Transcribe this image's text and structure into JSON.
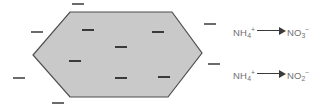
{
  "figure": {
    "name": "soil-colloid-nitrification-diagram",
    "background_color": "#ffffff"
  },
  "colloid": {
    "name": "hexagonal-soil-colloid",
    "shape": "hexagon",
    "fill_color": "#c9c9c9",
    "stroke_color": "#4d4d4d",
    "points": "70,12 172,12 202,53 168,97 70,97 33,55",
    "charge_symbol": "−"
  },
  "charges": {
    "symbol": "−",
    "color_interior": "#3a3a3a",
    "color_exterior": "#6b6b6b",
    "interior": [
      {
        "name": "charge-interior-1",
        "x": 88,
        "y": 30
      },
      {
        "name": "charge-interior-2",
        "x": 158,
        "y": 32
      },
      {
        "name": "charge-interior-3",
        "x": 121,
        "y": 47
      },
      {
        "name": "charge-interior-4",
        "x": 75,
        "y": 61
      },
      {
        "name": "charge-interior-5",
        "x": 121,
        "y": 78
      },
      {
        "name": "charge-interior-6",
        "x": 164,
        "y": 77
      }
    ],
    "exterior": [
      {
        "name": "charge-exterior-top",
        "x": 78,
        "y": 4
      },
      {
        "name": "charge-exterior-upper-left",
        "x": 37,
        "y": 32
      },
      {
        "name": "charge-exterior-left",
        "x": 19,
        "y": 78
      },
      {
        "name": "charge-exterior-bottom",
        "x": 58,
        "y": 103
      },
      {
        "name": "charge-exterior-upper-right",
        "x": 210,
        "y": 24
      },
      {
        "name": "charge-exterior-lower-right",
        "x": 214,
        "y": 64
      }
    ]
  },
  "reactions": [
    {
      "name": "reaction-ammonium-to-nitrate",
      "reactant": {
        "formula": "NH",
        "sub": "4",
        "sup": "+"
      },
      "arrow": "⟶",
      "product": {
        "formula": "NO",
        "sub": "3",
        "sup": "−"
      },
      "text": "NH4+ → NO3−"
    },
    {
      "name": "reaction-ammonium-to-nitrite",
      "reactant": {
        "formula": "NH",
        "sub": "4",
        "sup": "+"
      },
      "arrow": "⟶",
      "product": {
        "formula": "NO",
        "sub": "2",
        "sup": "−"
      },
      "text": "NH4+ → NO2−"
    }
  ]
}
